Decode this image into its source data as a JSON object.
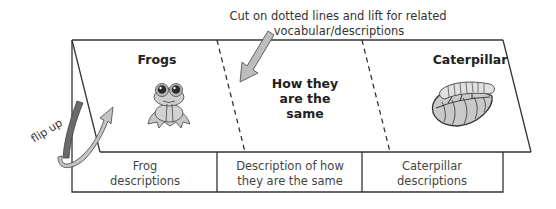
{
  "instruction": {
    "line1": "Cut on dotted lines and lift for related",
    "line2": "vocabular/descriptions"
  },
  "flip_label": "flip up",
  "flaps": [
    {
      "heading_lines": [
        "Frogs"
      ],
      "image": "frog-illustration"
    },
    {
      "heading_lines": [
        "How they",
        "are the",
        "same"
      ],
      "image": ""
    },
    {
      "heading_lines": [
        "Caterpillar"
      ],
      "image": "caterpillar-on-leaf-illustration"
    }
  ],
  "under_cells": [
    {
      "lines": [
        "Frog",
        "descriptions"
      ]
    },
    {
      "lines": [
        "Description of how",
        "they are the same"
      ]
    },
    {
      "lines": [
        "Caterpillar",
        "descriptions"
      ]
    }
  ],
  "colors": {
    "outline": "#333333",
    "arrow_light": "#bdbdbd",
    "arrow_dark": "#666666",
    "arrow_stroke": "#555555"
  }
}
